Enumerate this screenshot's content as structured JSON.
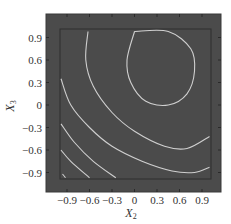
{
  "chart_data": {
    "type": "contour",
    "title": "",
    "xlabel": "X2",
    "ylabel": "X3",
    "xlabel_main": "X",
    "xlabel_sub": "2",
    "ylabel_main": "X",
    "ylabel_sub": "3",
    "xlim": [
      -1.1,
      1.1
    ],
    "ylim": [
      -1.1,
      1.1
    ],
    "x_ticks": [
      -0.9,
      -0.6,
      -0.3,
      0,
      0.3,
      0.6,
      0.9
    ],
    "x_tick_labels": [
      "−0.9",
      "−0.6",
      "−0.3",
      "0",
      "0.3",
      "0.6",
      "0.9"
    ],
    "y_ticks": [
      0.9,
      0.6,
      0.3,
      0,
      -0.3,
      -0.6,
      -0.9
    ],
    "y_tick_labels": [
      "0.9",
      "0.6",
      "0.3",
      "0",
      "−0.3",
      "−0.6",
      "−0.9"
    ],
    "grid": false,
    "legend": null,
    "background_color": "#4b4b4b",
    "contour_color": "#cfcfcf",
    "contours": [
      {
        "name": "closed-ellipse",
        "center": [
          0.45,
          0.5
        ],
        "shape": "closed",
        "points": [
          [
            0.0,
            0.98
          ],
          [
            0.45,
            0.98
          ],
          [
            0.75,
            0.75
          ],
          [
            0.8,
            0.45
          ],
          [
            0.7,
            0.15
          ],
          [
            0.45,
            0.0
          ],
          [
            0.15,
            0.05
          ],
          [
            -0.05,
            0.3
          ],
          [
            -0.1,
            0.6
          ],
          [
            0.0,
            0.98
          ]
        ]
      },
      {
        "name": "arc-1",
        "shape": "open",
        "points": [
          [
            -0.62,
            0.98
          ],
          [
            -0.65,
            0.6
          ],
          [
            -0.55,
            0.25
          ],
          [
            -0.3,
            -0.1
          ],
          [
            0.0,
            -0.35
          ],
          [
            0.4,
            -0.55
          ],
          [
            0.7,
            -0.58
          ],
          [
            1.0,
            -0.42
          ]
        ]
      },
      {
        "name": "arc-2",
        "shape": "open",
        "points": [
          [
            -0.98,
            0.35
          ],
          [
            -0.85,
            0.0
          ],
          [
            -0.6,
            -0.3
          ],
          [
            -0.3,
            -0.55
          ],
          [
            0.1,
            -0.75
          ],
          [
            0.5,
            -0.88
          ],
          [
            0.8,
            -0.9
          ],
          [
            1.0,
            -0.83
          ]
        ]
      },
      {
        "name": "arc-3",
        "shape": "open",
        "points": [
          [
            -0.98,
            -0.25
          ],
          [
            -0.8,
            -0.5
          ],
          [
            -0.55,
            -0.75
          ],
          [
            -0.25,
            -0.97
          ]
        ]
      },
      {
        "name": "arc-4",
        "shape": "open",
        "points": [
          [
            -0.98,
            -0.6
          ],
          [
            -0.85,
            -0.75
          ],
          [
            -0.6,
            -0.97
          ]
        ]
      },
      {
        "name": "arc-5",
        "shape": "open",
        "points": [
          [
            -0.96,
            -0.92
          ],
          [
            -0.92,
            -0.97
          ]
        ]
      }
    ]
  }
}
